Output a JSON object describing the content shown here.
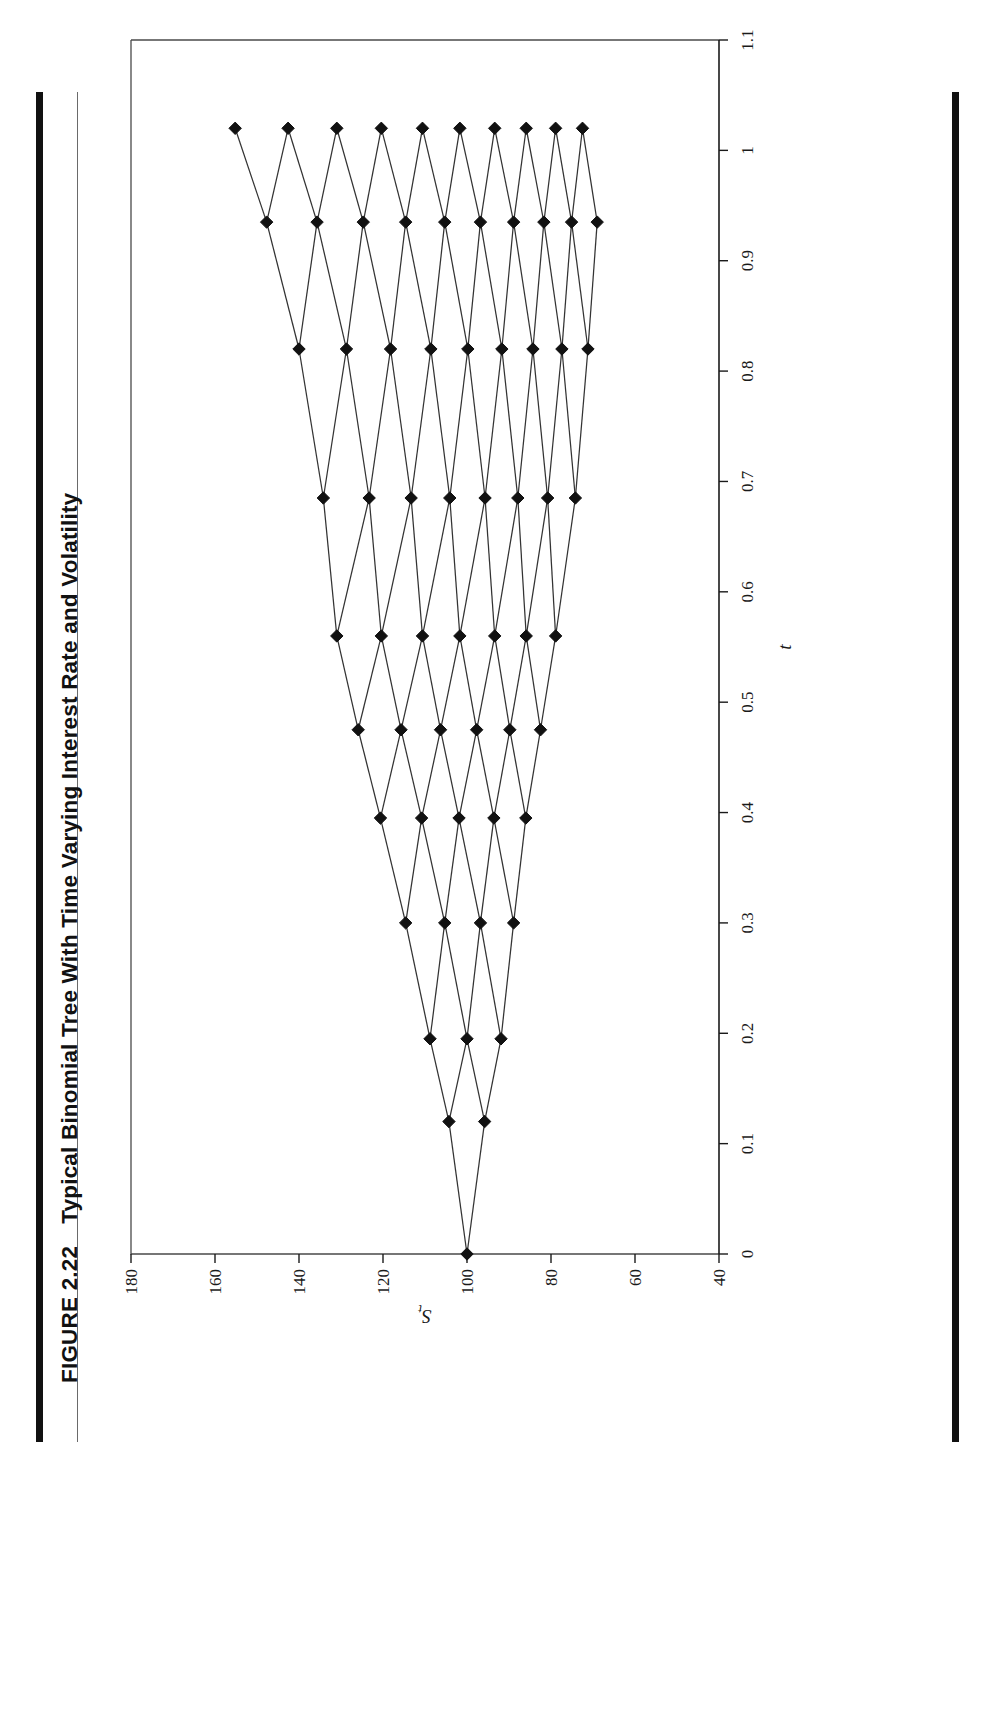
{
  "figure": {
    "number": "FIGURE 2.22",
    "caption": "Typical Binomial Tree With Time Varying Interest Rate and Volatility"
  },
  "chart_data": {
    "type": "line",
    "title": "Typical Binomial Tree With Time Varying Interest Rate and Volatility",
    "xlabel": "t",
    "ylabel": "S_t",
    "xlim": [
      0,
      1.1
    ],
    "ylim": [
      40,
      180
    ],
    "grid": false,
    "legend": null,
    "xticks": [
      0,
      0.1,
      0.2,
      0.3,
      0.4,
      0.5,
      0.6,
      0.7,
      0.8,
      0.9,
      1,
      1.1
    ],
    "xtick_labels": [
      "0",
      "0.1",
      "0.2",
      "0.3",
      "0.4",
      "0.5",
      "0.6",
      "0.7",
      "0.8",
      "0.9",
      "1",
      "1.1"
    ],
    "yticks": [
      40,
      60,
      80,
      100,
      120,
      140,
      160,
      180
    ],
    "ytick_labels": [
      "40",
      "60",
      "80",
      "100",
      "120",
      "140",
      "160",
      "180"
    ],
    "marker": "diamond",
    "marker_color": "#111111",
    "line_color": "#333333",
    "time_steps": [
      0,
      0.12,
      0.195,
      0.3,
      0.395,
      0.475,
      0.56,
      0.685,
      0.82,
      0.935,
      1.02
    ],
    "nodes": [
      {
        "t": 0,
        "values": [
          100
        ]
      },
      {
        "t": 0.12,
        "values": [
          104.3,
          95.8
        ]
      },
      {
        "t": 0.195,
        "values": [
          108.8,
          100.0,
          91.9
        ]
      },
      {
        "t": 0.3,
        "values": [
          114.6,
          105.3,
          96.8,
          88.9
        ]
      },
      {
        "t": 0.395,
        "values": [
          120.6,
          110.8,
          101.9,
          93.6,
          86.0
        ]
      },
      {
        "t": 0.475,
        "values": [
          125.9,
          115.7,
          106.3,
          97.7,
          89.8,
          82.5
        ]
      },
      {
        "t": 0.56,
        "values": [
          131.0,
          120.4,
          110.6,
          101.7,
          93.4,
          85.9,
          78.9
        ]
      },
      {
        "t": 0.685,
        "values": [
          134.2,
          123.3,
          113.3,
          104.1,
          95.7,
          87.9,
          80.8,
          74.2
        ]
      },
      {
        "t": 0.82,
        "values": [
          140.0,
          128.7,
          118.2,
          108.6,
          99.8,
          91.7,
          84.3,
          77.4,
          71.2
        ]
      },
      {
        "t": 0.935,
        "values": [
          147.7,
          135.7,
          124.7,
          114.6,
          105.3,
          96.8,
          88.9,
          81.7,
          75.1,
          69.0
        ]
      },
      {
        "t": 1.02,
        "values": [
          155.2,
          142.6,
          131.0,
          120.4,
          110.6,
          101.7,
          93.4,
          85.9,
          78.9,
          72.5
        ]
      }
    ]
  }
}
